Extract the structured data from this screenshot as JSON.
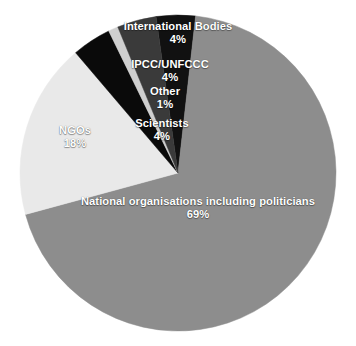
{
  "chart_data": {
    "type": "pie",
    "title": "",
    "subtitle": "",
    "xlabel": "",
    "ylabel": "",
    "legend_position": "none",
    "grid": false,
    "labels_inline": true,
    "categories": [
      "International Bodies",
      "National organisations including politicians",
      "NGOs",
      "Scientists",
      "Other",
      "IPCC/UNFCCC"
    ],
    "values": [
      4,
      69,
      18,
      4,
      1,
      4
    ],
    "value_labels": [
      "4%",
      "69%",
      "18%",
      "4%",
      "1%",
      "4%"
    ],
    "unit": "%",
    "start_angle_deg": -8,
    "direction": "clockwise",
    "slices": [
      {
        "name": "International Bodies",
        "value": 4,
        "value_label": "4%",
        "color": "#111111",
        "label_name": "International Bodies",
        "label_pct": "4%"
      },
      {
        "name": "National organisations including politicians",
        "value": 69,
        "value_label": "69%",
        "color": "#8d8d8d",
        "label_name": "National organisations including politicians",
        "label_pct": "69%"
      },
      {
        "name": "NGOs",
        "value": 18,
        "value_label": "18%",
        "color": "#e9e9e9",
        "label_name": "NGOs",
        "label_pct": "18%"
      },
      {
        "name": "Scientists",
        "value": 4,
        "value_label": "4%",
        "color": "#0a0a0a",
        "label_name": "Scientists",
        "label_pct": "4%"
      },
      {
        "name": "Other",
        "value": 1,
        "value_label": "1%",
        "color": "#cfcfcf",
        "label_name": "Other",
        "label_pct": "1%"
      },
      {
        "name": "IPCC/UNFCCC",
        "value": 4,
        "value_label": "4%",
        "color": "#3a3a3a",
        "label_name": "IPCC/UNFCCC",
        "label_pct": "4%"
      }
    ],
    "colors": {
      "international_bodies": "#111111",
      "national_organisations": "#8d8d8d",
      "ngos": "#e9e9e9",
      "scientists": "#0a0a0a",
      "other": "#cfcfcf",
      "ipcc_unfccc": "#3a3a3a",
      "label_text": "#ffffff",
      "background": "#ffffff"
    },
    "geometry": {
      "center_x": 178,
      "center_y": 173,
      "radius": 158
    }
  }
}
